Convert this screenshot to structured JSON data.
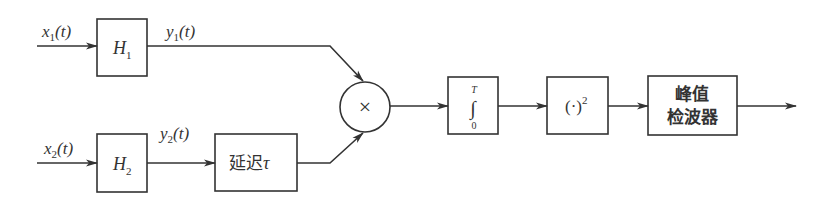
{
  "diagram": {
    "colors": {
      "stroke": "#333333",
      "background": "#ffffff"
    },
    "inputs": [
      {
        "id": "x1",
        "name": "x",
        "sub": "1",
        "arg": "(t)"
      },
      {
        "id": "x2",
        "name": "x",
        "sub": "2",
        "arg": "(t)"
      }
    ],
    "filters": [
      {
        "id": "H1",
        "name": "H",
        "sub": "1"
      },
      {
        "id": "H2",
        "name": "H",
        "sub": "2"
      }
    ],
    "filter_outputs": [
      {
        "id": "y1",
        "name": "y",
        "sub": "1",
        "arg": "(t)"
      },
      {
        "id": "y2",
        "name": "y",
        "sub": "2",
        "arg": "(t)"
      }
    ],
    "delay": {
      "label": "延迟",
      "symbol": "τ"
    },
    "multiplier": {
      "symbol": "×"
    },
    "integrator": {
      "upper": "T",
      "symbol": "∫",
      "lower": "0"
    },
    "square": {
      "label": "(·)",
      "exp": "2"
    },
    "peak_detector": {
      "line1": "峰值",
      "line2": "检波器"
    }
  }
}
